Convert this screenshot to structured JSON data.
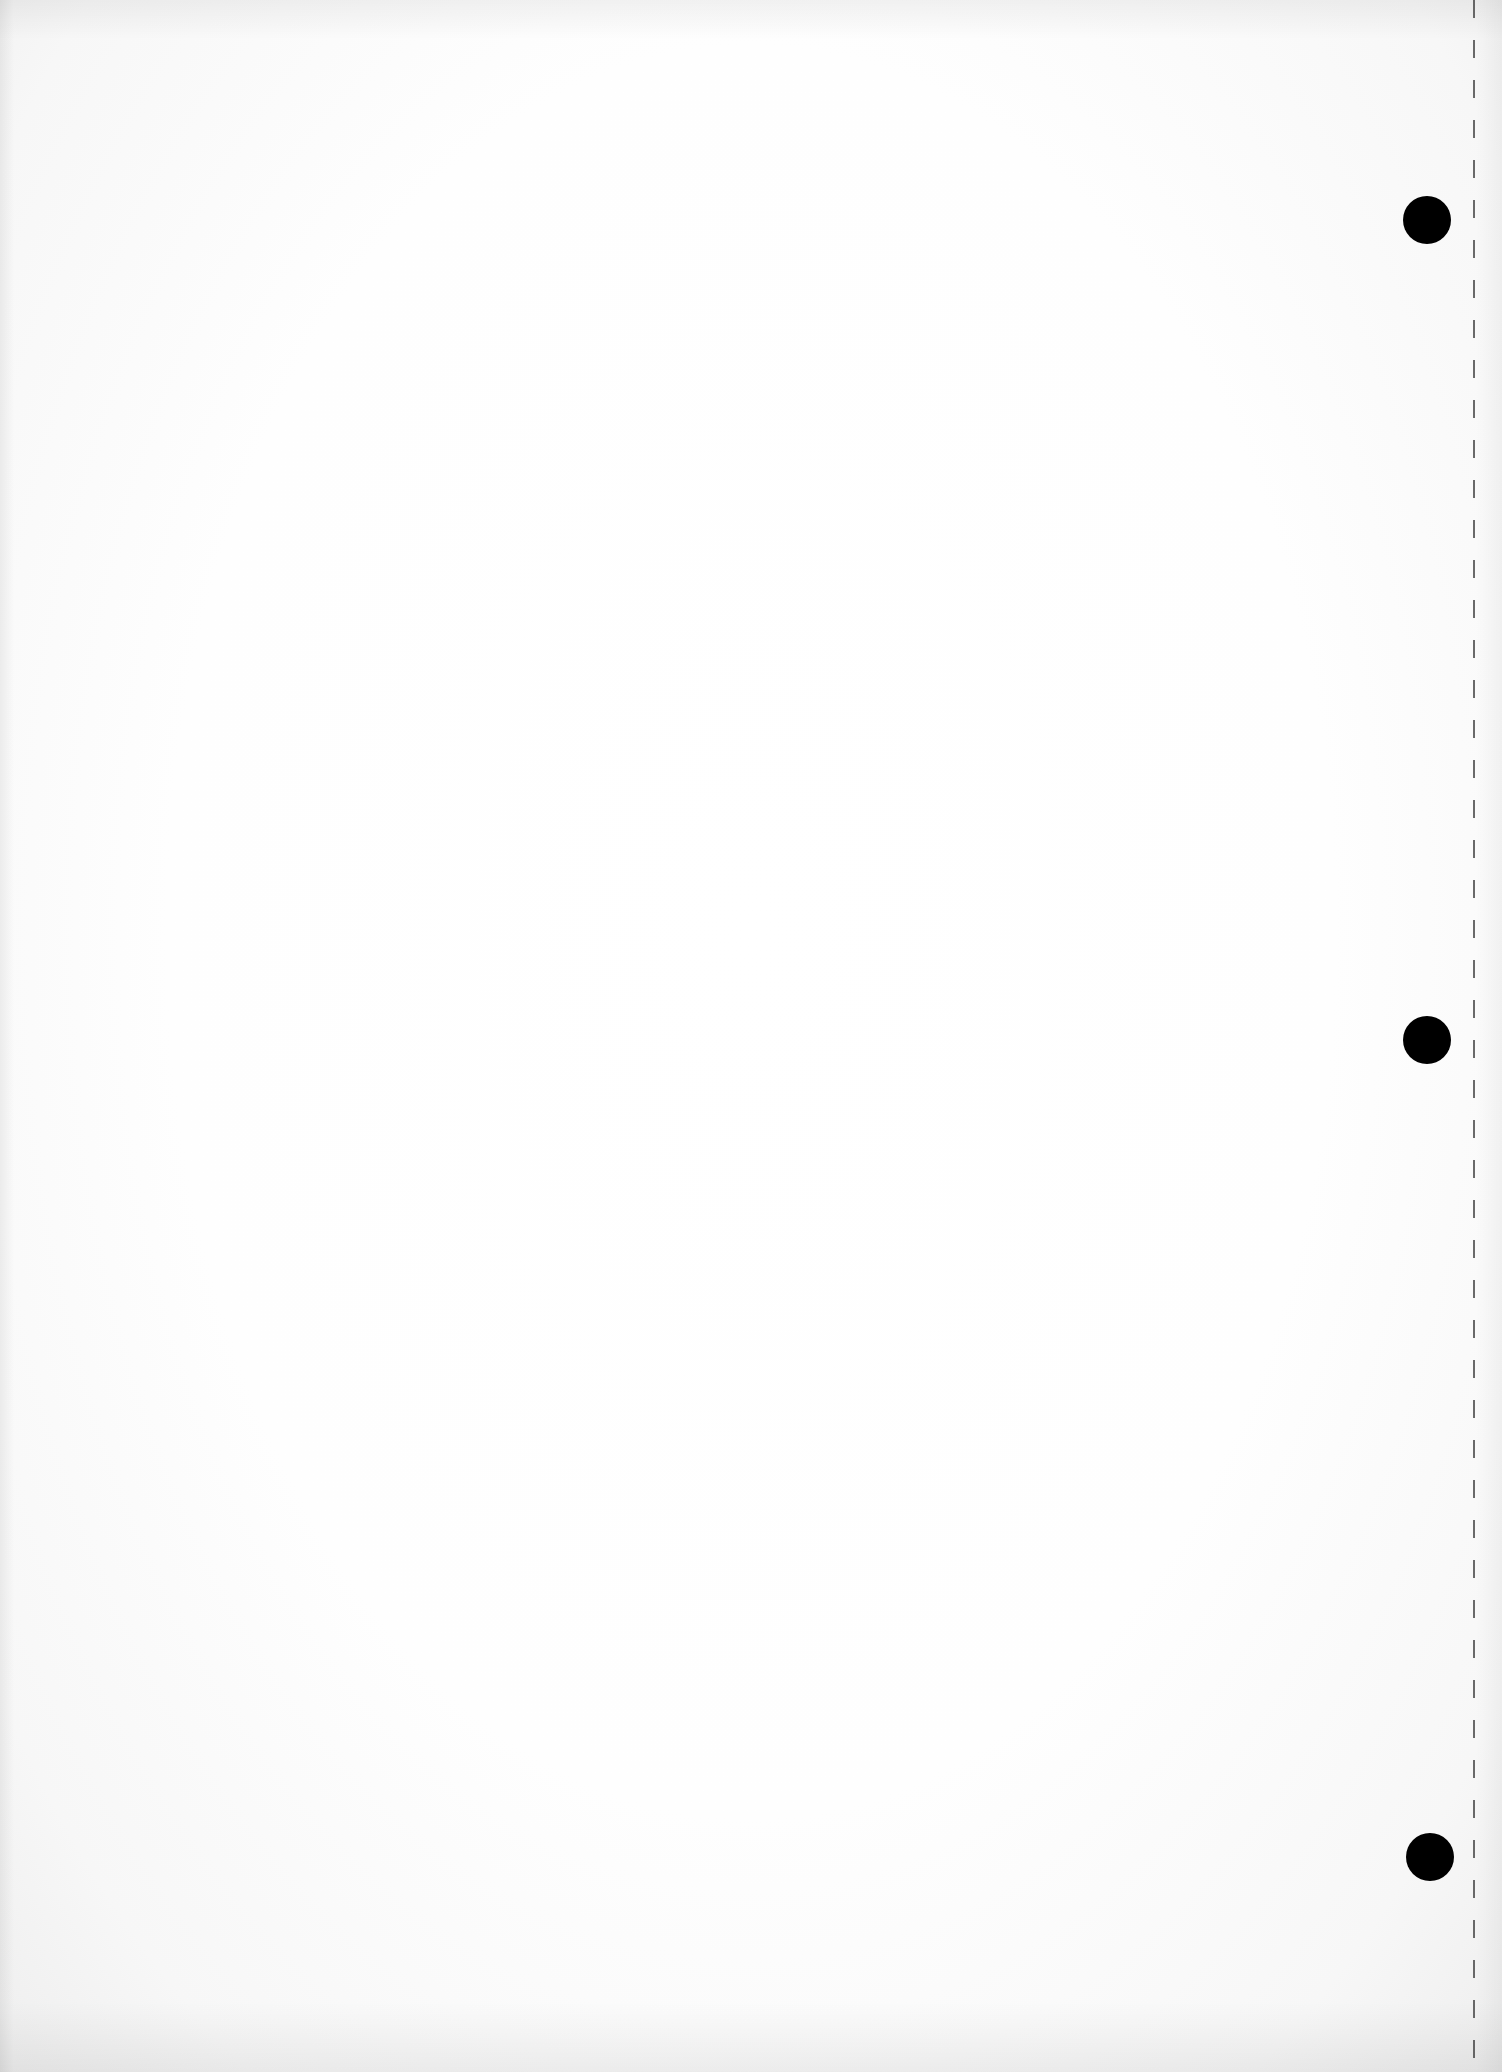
{
  "page": {
    "type": "blank loose-leaf sheet",
    "background_color": "#ffffff",
    "text_content": ""
  },
  "punch_holes": [
    {
      "label": "top-hole",
      "cx": 1427,
      "cy": 220,
      "r": 24,
      "color": "#000000"
    },
    {
      "label": "middle-hole",
      "cx": 1427,
      "cy": 1040,
      "r": 24,
      "color": "#000000"
    },
    {
      "label": "bottom-hole",
      "cx": 1430,
      "cy": 1857,
      "r": 24,
      "color": "#000000"
    }
  ],
  "perforation_line": {
    "x": 1473,
    "style": "dashed",
    "color": "#3a3a3a"
  }
}
